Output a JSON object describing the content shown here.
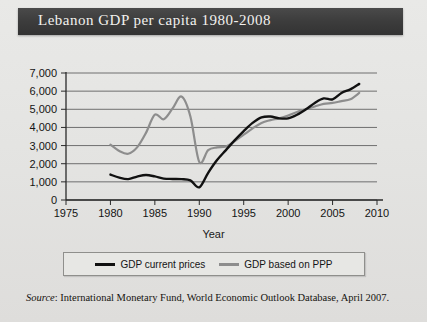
{
  "title": "Lebanon GDP per capita 1980-2008",
  "source": {
    "label": "Source",
    "separator": ": ",
    "text": "International Monetary Fund, World Economic Outlook Database, April 2007."
  },
  "legend": {
    "items": [
      {
        "label": "GDP current prices",
        "color": "#111111"
      },
      {
        "label": "GDP based on PPP",
        "color": "#8d8d8d"
      }
    ]
  },
  "colors": {
    "background": "#e6e6e4",
    "title_bar": "#3c3c3c",
    "title_text": "#f2f1ee",
    "gridline": "#6f6f6f",
    "axis": "#2a2a2a",
    "series_current_prices": "#111111",
    "series_ppp": "#8d8d8d"
  },
  "chart_data": {
    "type": "line",
    "title": "Lebanon GDP per capita 1980-2008",
    "xlabel": "Year",
    "ylabel": "",
    "xlim": [
      1975,
      2010
    ],
    "ylim": [
      0,
      7000
    ],
    "xticks": [
      1975,
      1980,
      1985,
      1990,
      1995,
      2000,
      2005,
      2010
    ],
    "xtick_labels": [
      "1975",
      "1980",
      "1985",
      "1990",
      "1995",
      "2000",
      "2005",
      "2010"
    ],
    "yticks": [
      0,
      1000,
      2000,
      3000,
      4000,
      5000,
      6000,
      7000
    ],
    "ytick_labels": [
      "0",
      "1,000",
      "2,000",
      "3,000",
      "4,000",
      "5,000",
      "6,000",
      "7,000"
    ],
    "grid": true,
    "grid_axis": "y",
    "legend_position": "below",
    "x": [
      1980,
      1981,
      1982,
      1983,
      1984,
      1985,
      1986,
      1987,
      1988,
      1989,
      1990,
      1991,
      1992,
      1993,
      1994,
      1995,
      1996,
      1997,
      1998,
      1999,
      2000,
      2001,
      2002,
      2003,
      2004,
      2005,
      2006,
      2007,
      2008
    ],
    "series": [
      {
        "name": "GDP current prices",
        "color": "#111111",
        "values": [
          1400,
          1230,
          1150,
          1290,
          1380,
          1300,
          1180,
          1160,
          1150,
          1080,
          700,
          1500,
          2200,
          2750,
          3300,
          3800,
          4250,
          4550,
          4600,
          4500,
          4500,
          4700,
          5000,
          5350,
          5600,
          5550,
          5900,
          6100,
          6400
        ]
      },
      {
        "name": "GDP based on PPP",
        "color": "#8d8d8d",
        "values": [
          3050,
          2700,
          2550,
          2900,
          3700,
          4700,
          4450,
          5050,
          5700,
          4600,
          2100,
          2750,
          2900,
          2950,
          3250,
          3600,
          3950,
          4250,
          4400,
          4500,
          4650,
          4850,
          5000,
          5150,
          5300,
          5350,
          5450,
          5550,
          5900
        ]
      }
    ]
  }
}
